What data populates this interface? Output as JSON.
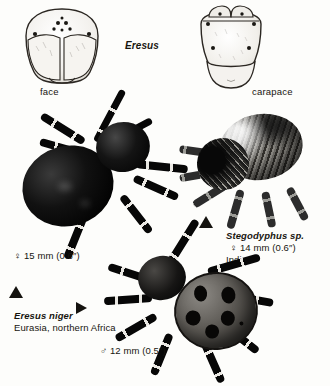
{
  "plate": {
    "genus_heading": "Eresus",
    "diagrams": [
      {
        "name": "face-diagram",
        "caption": "face"
      },
      {
        "name": "carapace-diagram",
        "caption": "carapace"
      }
    ],
    "specimens": [
      {
        "id": "eresus-niger-female",
        "common_layout": "top-left photo",
        "sex_symbol": "♀",
        "measurement": "15 mm (0.6″)",
        "measurement_line": "♀  15 mm (0.6″)"
      },
      {
        "id": "stegodyphus-sp-female",
        "common_layout": "right photo",
        "species": "Stegodyphus sp.",
        "sex_symbol": "♀",
        "measurement": "14 mm (0.6″)",
        "measurement_line": "♀  14 mm (0.6″)",
        "locality": "India"
      },
      {
        "id": "eresus-niger-male",
        "common_layout": "bottom-centre photo",
        "sex_symbol": "♂",
        "measurement": "12 mm (0.5″)",
        "measurement_line": "♂  12 mm (0.5″)"
      }
    ],
    "species_label": {
      "name": "Eresus niger",
      "range": "Eurasia, northern Africa"
    },
    "markers": [
      {
        "name": "arrow-up-stegodyphus",
        "glyph": "▲"
      },
      {
        "name": "arrow-up-eresus-male",
        "glyph": "▲"
      },
      {
        "name": "arrow-right-eresus-female",
        "glyph": "▶"
      }
    ],
    "colors": {
      "page_background": "#fdfdfb",
      "ink": "#17150f",
      "line_art": "#2b2722"
    }
  }
}
